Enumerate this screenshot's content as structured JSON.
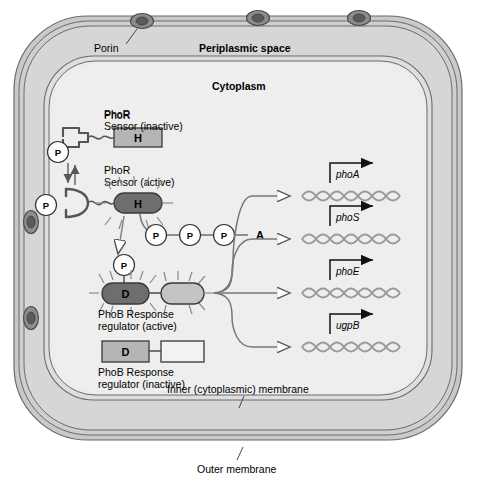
{
  "figure": {
    "canvas": {
      "width": 495,
      "height": 483
    }
  },
  "colors": {
    "outer_membrane_fill": "#c8c8c8",
    "periplasm_fill": "#d4d4d4",
    "cytoplasm_fill": "#e6e6e6",
    "inactive_box_fill": "#b3b3b3",
    "active_dark_fill": "#6e6e6e",
    "active_light_fill": "#c0c0c0",
    "porin_fill": "#707070",
    "line_stroke": "#555555",
    "text": "#000000",
    "dna_stroke": "#9a9a9a",
    "arrow_stroke": "#666666"
  },
  "compartments": {
    "outer_membrane_label": "Outer membrane",
    "periplasm_label": "Periplasmic space",
    "cytoplasm_label": "Cytoplasm",
    "inner_membrane_label": "Inner (cytoplasmic) membrane",
    "porin_label": "Porin"
  },
  "sensor": {
    "inactive": {
      "title_line1": "PhoR",
      "title_line2": "Sensor (inactive)",
      "node_letter": "H"
    },
    "active": {
      "title_line1": "PhoR",
      "title_line2": "Sensor (active)",
      "node_letter": "H"
    }
  },
  "response_regulator": {
    "active": {
      "node_letter": "D",
      "caption_line1": "PhoB Response",
      "caption_line2": "regulator (active)"
    },
    "inactive": {
      "node_letter": "D",
      "caption_line1": "PhoB Response",
      "caption_line2": "regulator (inactive)"
    }
  },
  "phosphates": {
    "receptor_upper_label": "P",
    "receptor_lower_label": "P",
    "transfer_label": "P",
    "atp_chain": [
      "P",
      "P",
      "P"
    ],
    "atp_adenosine": "A"
  },
  "genes": [
    {
      "name": "phoA"
    },
    {
      "name": "phoS"
    },
    {
      "name": "phoE"
    },
    {
      "name": "ugpB"
    }
  ],
  "porins": {
    "count": 5,
    "positions": [
      "top-left",
      "top-middle",
      "top-right",
      "left-upper",
      "left-lower"
    ]
  }
}
